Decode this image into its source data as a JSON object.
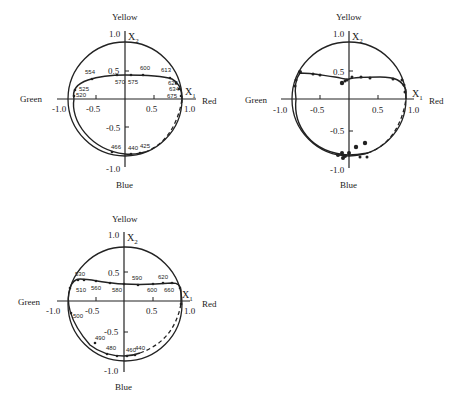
{
  "panels": [
    {
      "id": "top-left",
      "labels": {
        "top": "Yellow",
        "bottom": "Blue",
        "left": "Green",
        "right": "Red",
        "x_axis": "X",
        "x_sub": "1",
        "y_axis": "X",
        "y_sub": "2"
      },
      "ticks": {
        "x_neg1": "-1.0",
        "x_neg05": "-0.5",
        "x_05": "0.5",
        "x_1": "1.0",
        "y_1": "1.0",
        "y_05": "0.5",
        "y_neg05": "-0.5",
        "y_neg1": "-1.0"
      },
      "wavelengths": [
        "554",
        "600",
        "613",
        "570",
        "575",
        "525",
        "520",
        "625",
        "634",
        "675",
        "466",
        "440",
        "425"
      ]
    },
    {
      "id": "top-right",
      "labels": {
        "top": "Yellow",
        "bottom": "Blue",
        "left": "Green",
        "right": "Red",
        "x_axis": "X",
        "x_sub": "1",
        "y_axis": "X",
        "y_sub": "2"
      },
      "ticks": {
        "x_neg1": "-1.0",
        "x_neg05": "-0.5",
        "x_05": "0.5",
        "x_1": "1.0",
        "y_1": "1.0",
        "y_05": "0.5",
        "y_neg05": "-0.5",
        "y_neg1": "-1.0"
      }
    },
    {
      "id": "bottom-left",
      "labels": {
        "top": "Yellow",
        "bottom": "Blue",
        "left": "Green",
        "right": "Red",
        "x_axis": "X",
        "x_sub": "1",
        "y_axis": "X",
        "y_sub": "2"
      },
      "ticks": {
        "x_neg1": "-1.0",
        "x_neg05": "-0.5",
        "x_05": "0.5",
        "x_1": "1.0",
        "y_1": "1.0",
        "y_05": "0.5",
        "y_neg05": "-0.5",
        "y_neg1": "-1.0"
      },
      "wavelengths": [
        "530",
        "590",
        "620",
        "510",
        "560",
        "580",
        "600",
        "660",
        "500",
        "490",
        "480",
        "460",
        "440"
      ]
    }
  ]
}
